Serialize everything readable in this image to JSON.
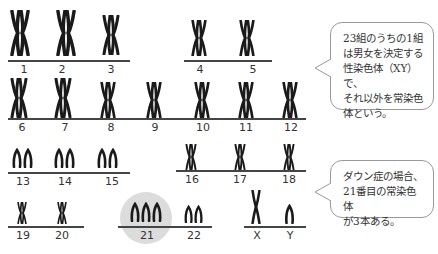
{
  "diagram": {
    "colors": {
      "chromosome": "#1a1a1a",
      "line": "#444444",
      "highlight": "#dcdcdc",
      "bubble_border": "#999999"
    },
    "chromosomes": [
      {
        "label": "1",
        "shape": "XX",
        "count": 2
      },
      {
        "label": "2",
        "shape": "XX",
        "count": 2
      },
      {
        "label": "3",
        "shape": "XX",
        "count": 2
      },
      {
        "label": "4",
        "shape": "XX",
        "count": 2
      },
      {
        "label": "5",
        "shape": "XX",
        "count": 2
      },
      {
        "label": "6",
        "shape": "XX",
        "count": 2
      },
      {
        "label": "7",
        "shape": "XX",
        "count": 2
      },
      {
        "label": "8",
        "shape": "XX",
        "count": 2
      },
      {
        "label": "9",
        "shape": "XX",
        "count": 2
      },
      {
        "label": "10",
        "shape": "XX",
        "count": 2
      },
      {
        "label": "11",
        "shape": "XX",
        "count": 2
      },
      {
        "label": "12",
        "shape": "XX",
        "count": 2
      },
      {
        "label": "13",
        "shape": "acrocentric",
        "count": 2
      },
      {
        "label": "14",
        "shape": "acrocentric",
        "count": 2
      },
      {
        "label": "15",
        "shape": "acrocentric",
        "count": 2
      },
      {
        "label": "16",
        "shape": "XX",
        "count": 2
      },
      {
        "label": "17",
        "shape": "XX",
        "count": 2
      },
      {
        "label": "18",
        "shape": "XX",
        "count": 2
      },
      {
        "label": "19",
        "shape": "XX",
        "count": 2
      },
      {
        "label": "20",
        "shape": "XX",
        "count": 2
      },
      {
        "label": "21",
        "shape": "acrocentric",
        "count": 3,
        "highlighted": true
      },
      {
        "label": "22",
        "shape": "acrocentric",
        "count": 2
      },
      {
        "label": "X",
        "shape": "X",
        "count": 1
      },
      {
        "label": "Y",
        "shape": "acrocentric",
        "count": 1
      }
    ],
    "callouts": [
      {
        "text": "23組のうちの1組は男女を決定する性染色体（XY）で、それ以外を常染色体という。",
        "lines": [
          "23組のうちの1組",
          "は男女を決定する",
          "性染色体（XY）で、",
          "それ以外を常染色",
          "体という。"
        ]
      },
      {
        "text": "ダウン症の場合、21番目の常染色体が3本ある。",
        "lines": [
          "ダウン症の場合、",
          "21番目の常染色体",
          "が3本ある。"
        ]
      }
    ]
  }
}
